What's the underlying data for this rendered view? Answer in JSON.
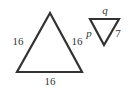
{
  "figure": {
    "large_triangle": {
      "sides": {
        "left": "16",
        "right": "16",
        "bottom": "16"
      }
    },
    "small_triangle": {
      "sides": {
        "top": "q",
        "left": "p",
        "right": "7"
      }
    },
    "colors": {
      "stroke": "#333333",
      "background": "#ffffff"
    }
  }
}
